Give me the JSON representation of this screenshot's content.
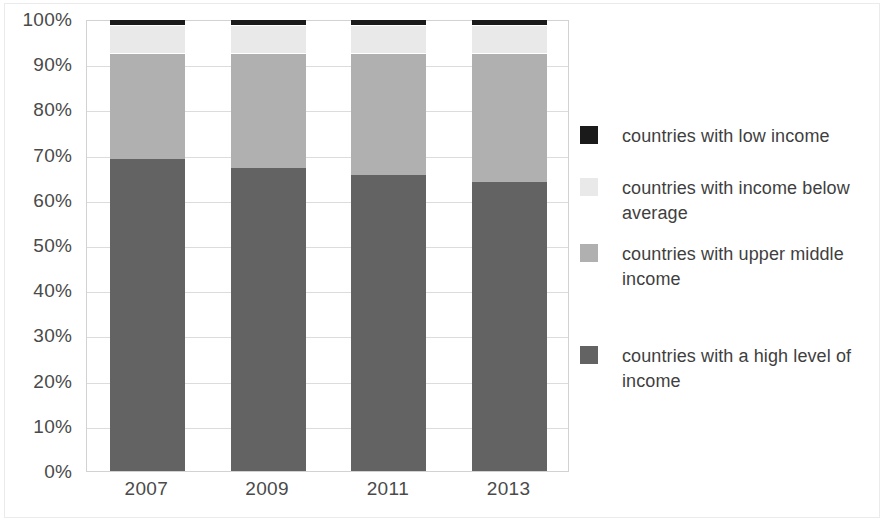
{
  "chart_data": {
    "type": "bar",
    "subtype": "stacked-100-percent",
    "title": "",
    "subtitle": "",
    "xlabel": "",
    "ylabel": "",
    "categories": [
      "2007",
      "2009",
      "2011",
      "2013"
    ],
    "ylim": [
      0,
      100
    ],
    "ytick_labels": [
      "0%",
      "10%",
      "20%",
      "30%",
      "40%",
      "50%",
      "60%",
      "70%",
      "80%",
      "90%",
      "100%"
    ],
    "ytick_values": [
      0,
      10,
      20,
      30,
      40,
      50,
      60,
      70,
      80,
      90,
      100
    ],
    "grid": true,
    "grid_axis": "y",
    "legend_position": "right",
    "stack_order_bottom_to_top": [
      "countries with a high level of income",
      "countries with upper middle income",
      "countries with income below average",
      "countries with low income"
    ],
    "series": [
      {
        "name": "countries with a high level of income",
        "color": "#636363",
        "values": [
          69,
          67,
          65.5,
          64
        ]
      },
      {
        "name": "countries with upper middle income",
        "color": "#b0b0b0",
        "values": [
          23.5,
          25.5,
          27,
          28.5
        ]
      },
      {
        "name": "countries with income below average",
        "color": "#e9e9e9",
        "values": [
          6.2,
          6.2,
          6.2,
          6.2
        ]
      },
      {
        "name": "countries with low income",
        "color": "#1a1a1a",
        "values": [
          1.3,
          1.3,
          1.3,
          1.3
        ]
      }
    ]
  },
  "legend": {
    "items": [
      {
        "label": "countries with low income",
        "color": "#1a1a1a"
      },
      {
        "label": "countries with income below average",
        "color": "#e9e9e9"
      },
      {
        "label": "countries with upper middle income",
        "color": "#b0b0b0"
      },
      {
        "label": "countries with a high level of income",
        "color": "#636363"
      }
    ]
  },
  "colors": {
    "plot_border": "#d2d2d2",
    "gridline": "#dcdcdc",
    "axis_text": "#4a4a4a",
    "legend_text": "#3f3f3f",
    "background": "#ffffff"
  }
}
